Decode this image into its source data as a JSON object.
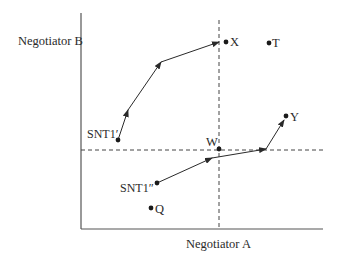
{
  "diagram": {
    "axes": {
      "y_label": "Negotiator B",
      "x_label": "Negotiator A"
    },
    "points": {
      "X": {
        "label": "X"
      },
      "T": {
        "label": "T"
      },
      "Y": {
        "label": "Y"
      },
      "W": {
        "label": "W"
      },
      "SNT1_prime": {
        "label": "SNT1′"
      },
      "SNT1_double_prime": {
        "label": "SNT1″"
      },
      "Q": {
        "label": "Q"
      }
    },
    "paths": [
      {
        "name": "path-snt1-prime-to-x",
        "from": "SNT1′",
        "to": "X"
      },
      {
        "name": "path-snt1-double-prime-to-y",
        "from": "SNT1″",
        "to": "Y"
      }
    ],
    "reference_lines": [
      {
        "name": "vertical-dashed-through-W",
        "style": "dashed"
      },
      {
        "name": "horizontal-dashed-through-W",
        "style": "dashed"
      }
    ],
    "colors": {
      "ink": "#2a2a2a",
      "axis": "#555555",
      "background": "#ffffff"
    }
  }
}
